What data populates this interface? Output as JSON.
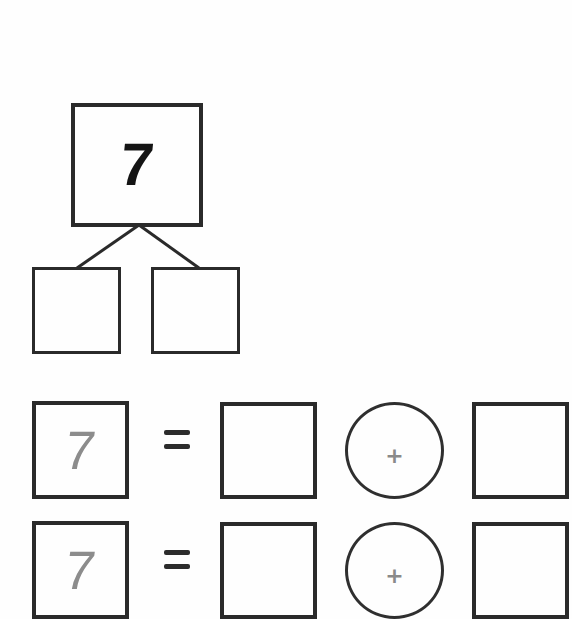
{
  "number_bond": {
    "whole": "7",
    "parts": [
      "",
      ""
    ]
  },
  "equations": [
    {
      "total": "7",
      "equals": "=",
      "addend_a": "",
      "operator": "+",
      "addend_b": ""
    },
    {
      "total": "7",
      "equals": "=",
      "addend_a": "",
      "operator": "+",
      "addend_b": ""
    }
  ],
  "colors": {
    "line": "#2a2a2a",
    "faint_digit": "#8c8c8c",
    "operator": "#8a8a8a",
    "background": "#fefefe"
  }
}
